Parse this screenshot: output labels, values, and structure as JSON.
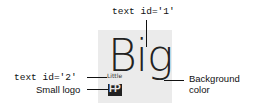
{
  "tile": {
    "background_color": "#ebebeb"
  },
  "text1": {
    "content": "Big",
    "label": "text id='1'"
  },
  "text2": {
    "content": "Little",
    "label": "text id='2'"
  },
  "logo": {
    "glyph": "FP",
    "label": "Small logo"
  },
  "background": {
    "label_line1": "Background",
    "label_line2": "color"
  }
}
